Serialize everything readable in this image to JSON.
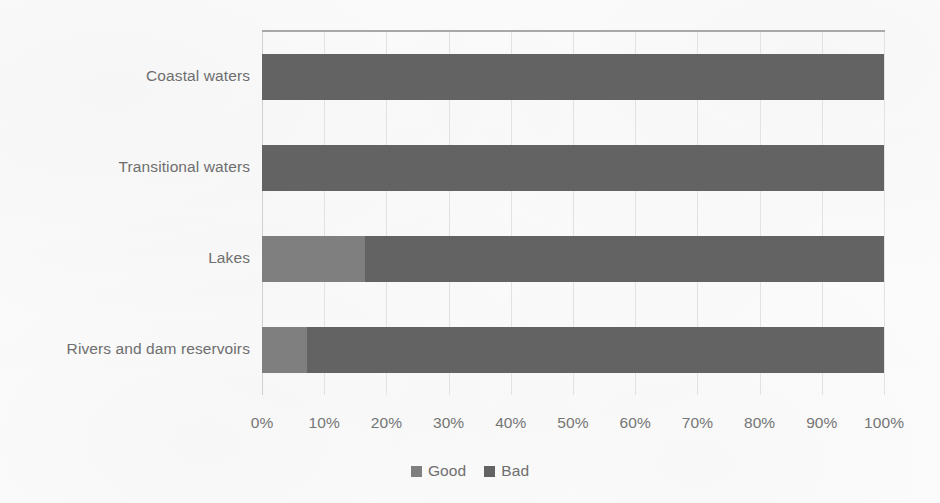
{
  "chart_data": {
    "type": "bar",
    "orientation": "horizontal",
    "stacked": true,
    "normalized": "100%",
    "title": "",
    "subtitle": "",
    "xlabel": "",
    "ylabel": "",
    "xlim": [
      0,
      100
    ],
    "grid": true,
    "legend_position": "bottom",
    "categories": [
      "Coastal waters",
      "Transitional waters",
      "Lakes",
      "Rivers and dam reservoirs"
    ],
    "series": [
      {
        "name": "Good",
        "color": "#7f7f7f",
        "values": [
          0,
          0,
          16.5,
          7.3
        ]
      },
      {
        "name": "Bad",
        "color": "#636363",
        "values": [
          100,
          100,
          83.5,
          92.7
        ]
      }
    ],
    "xticks": [
      0,
      10,
      20,
      30,
      40,
      50,
      60,
      70,
      80,
      90,
      100
    ],
    "xtick_labels": [
      "0%",
      "10%",
      "20%",
      "30%",
      "40%",
      "50%",
      "60%",
      "70%",
      "80%",
      "90%",
      "100%"
    ],
    "annotations": []
  },
  "legend": {
    "items": [
      {
        "label": "Good",
        "color": "#7f7f7f"
      },
      {
        "label": "Bad",
        "color": "#636363"
      }
    ]
  },
  "colors": {
    "good": "#7f7f7f",
    "bad": "#636363",
    "gridline": "#e2e2e2",
    "axis": "#a8a8a8",
    "text": "#6e6e6e",
    "background": "#fcfcfc"
  }
}
